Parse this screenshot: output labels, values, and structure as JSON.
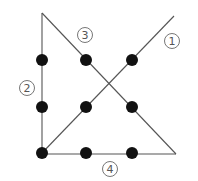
{
  "diagram": {
    "colors": {
      "line": "#555555",
      "dot": "#111111",
      "label": "#555555",
      "background": "#ffffff"
    },
    "dots": [
      {
        "x": 42,
        "y": 60
      },
      {
        "x": 86,
        "y": 60
      },
      {
        "x": 132,
        "y": 60
      },
      {
        "x": 42,
        "y": 107
      },
      {
        "x": 86,
        "y": 107
      },
      {
        "x": 132,
        "y": 107
      },
      {
        "x": 42,
        "y": 153
      },
      {
        "x": 86,
        "y": 153
      },
      {
        "x": 132,
        "y": 153
      }
    ],
    "segments": [
      {
        "id": "1",
        "label": "1",
        "from": [
          42,
          153
        ],
        "to": [
          174,
          16
        ],
        "label_pos": [
          171,
          41
        ]
      },
      {
        "id": "2",
        "label": "2",
        "from": [
          42,
          153
        ],
        "to": [
          42,
          13
        ],
        "label_pos": [
          27,
          88
        ]
      },
      {
        "id": "3",
        "label": "3",
        "from": [
          42,
          13
        ],
        "to": [
          176,
          154
        ],
        "label_pos": [
          85,
          35
        ]
      },
      {
        "id": "4",
        "label": "4",
        "from": [
          176,
          154
        ],
        "to": [
          42,
          154
        ],
        "label_pos": [
          110,
          169
        ]
      }
    ]
  }
}
